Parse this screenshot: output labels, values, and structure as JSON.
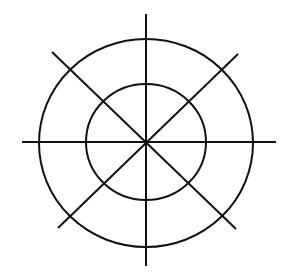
{
  "diagram": {
    "type": "concentric-circles-with-radial-lines",
    "background": "#ffffff",
    "stroke_color": "#111111",
    "center": [
      146,
      142
    ],
    "circles": [
      {
        "name": "outer-circle",
        "cx": 146,
        "cy": 143,
        "rx": 107,
        "ry": 104
      },
      {
        "name": "inner-circle",
        "cx": 146,
        "cy": 142,
        "rx": 60,
        "ry": 58
      }
    ],
    "lines": [
      {
        "name": "vertical-line",
        "x1": 146,
        "y1": 14,
        "x2": 146,
        "y2": 266
      },
      {
        "name": "horizontal-line",
        "x1": 22,
        "y1": 142,
        "x2": 276,
        "y2": 142
      },
      {
        "name": "diagonal-line-nw-se",
        "x1": 52,
        "y1": 52,
        "x2": 236,
        "y2": 229
      },
      {
        "name": "diagonal-line-ne-sw",
        "x1": 238,
        "y1": 54,
        "x2": 58,
        "y2": 228
      }
    ]
  }
}
